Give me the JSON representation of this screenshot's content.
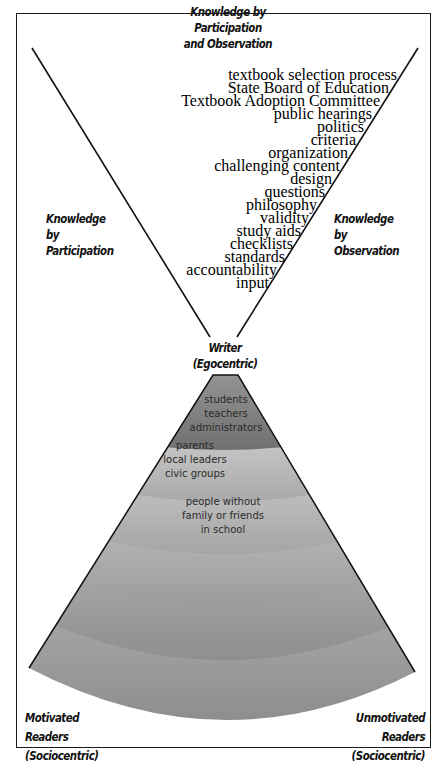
{
  "title": {
    "line1": "Knowledge by Participation",
    "line2": "and Observation"
  },
  "participation": {
    "line1": "Knowledge by",
    "line2": "Participation"
  },
  "observation": {
    "line1": "Knowledge by",
    "line2": "Observation",
    "items": [
      "textbook selection process",
      "State Board of Education",
      "Textbook Adoption Committee",
      "public hearings",
      "politics",
      "criteria",
      "organization",
      "challenging content",
      "design",
      "questions",
      "philosophy",
      "validity",
      "study aids",
      "checklists",
      "standards",
      "accountability",
      "input"
    ]
  },
  "writer": {
    "line1": "Writer",
    "line2": "(Egocentric)"
  },
  "bands": [
    {
      "lines": [
        "students",
        "teachers",
        "administrators"
      ],
      "color": "#8a8a8a"
    },
    {
      "lines": [
        "parents",
        "local leaders",
        "civic groups"
      ],
      "color": "#b9b9b9"
    },
    {
      "lines": [
        "people without",
        "family or friends",
        "in school"
      ],
      "color": "#bdbdbd"
    },
    {
      "lines": [],
      "color": "#b4b4b4"
    },
    {
      "lines": [],
      "color": "#a8a8a8"
    },
    {
      "lines": [],
      "color": "#9c9c9c"
    }
  ],
  "readers": {
    "motivated_line1": "Motivated Readers",
    "motivated_line2": "(Sociocentric)",
    "unmotivated_line1": "Unmotivated Readers",
    "unmotivated_line2": "(Sociocentric)"
  }
}
